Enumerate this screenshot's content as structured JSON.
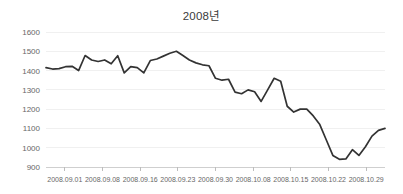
{
  "chart_data": {
    "type": "line",
    "title": "2008년",
    "xlabel": "",
    "ylabel": "",
    "ylim": [
      900,
      1600
    ],
    "ytick_values": [
      1600,
      1500,
      1400,
      1300,
      1200,
      1100,
      1000,
      900
    ],
    "ytick_labels": [
      "1600",
      "1500",
      "1400",
      "1300",
      "1200",
      "1100",
      "1000",
      "900"
    ],
    "xtick_labels": [
      "2008.09.01",
      "2008.09.08",
      "2008.09.16",
      "2008.09.23",
      "2008.09.30",
      "2008.10.08",
      "2008.10.15",
      "2008.10.22",
      "2008.10.29"
    ],
    "xtick_indices": [
      0,
      5,
      10,
      15,
      20,
      25,
      30,
      35,
      40
    ],
    "grid": true,
    "legend": "none",
    "series": [
      {
        "name": "KOSPI",
        "color": "#333333",
        "x": [
          "2008.09.01",
          "2008.09.02",
          "2008.09.03",
          "2008.09.04",
          "2008.09.05",
          "2008.09.08",
          "2008.09.09",
          "2008.09.10",
          "2008.09.11",
          "2008.09.12",
          "2008.09.16",
          "2008.09.17",
          "2008.09.18",
          "2008.09.19",
          "2008.09.22",
          "2008.09.23",
          "2008.09.24",
          "2008.09.25",
          "2008.09.26",
          "2008.09.29",
          "2008.09.30",
          "2008.10.01",
          "2008.10.02",
          "2008.10.06",
          "2008.10.07",
          "2008.10.08",
          "2008.10.09",
          "2008.10.10",
          "2008.10.13",
          "2008.10.14",
          "2008.10.15",
          "2008.10.16",
          "2008.10.17",
          "2008.10.20",
          "2008.10.21",
          "2008.10.22",
          "2008.10.23",
          "2008.10.24",
          "2008.10.27",
          "2008.10.28",
          "2008.10.29",
          "2008.10.30"
        ],
        "values": [
          1415,
          1408,
          1410,
          1420,
          1422,
          1400,
          1478,
          1455,
          1447,
          1455,
          1435,
          1477,
          1388,
          1420,
          1415,
          1388,
          1452,
          1460,
          1475,
          1490,
          1500,
          1478,
          1455,
          1440,
          1430,
          1425,
          1360,
          1350,
          1355,
          1288,
          1280,
          1300,
          1290,
          1240,
          1300,
          1360,
          1345,
          1215,
          1185,
          1200,
          1200,
          1165
        ]
      }
    ],
    "extended_values": [
      1120,
      1040,
      960,
      940,
      942,
      990,
      960,
      1005,
      1060,
      1090,
      1100
    ]
  },
  "axis_colors": {
    "grid": "#f0f0f0",
    "axis": "#cfcfcf",
    "tick": "#bdbdbd",
    "text": "#676767",
    "line": "#333333"
  }
}
